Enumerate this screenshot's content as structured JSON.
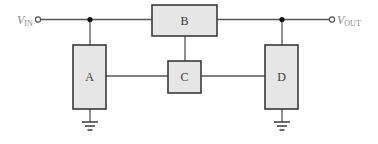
{
  "diagram": {
    "type": "block-diagram",
    "terminals": {
      "input": {
        "symbol": "V",
        "subscript": "IN"
      },
      "output": {
        "symbol": "V",
        "subscript": "OUT"
      }
    },
    "blocks": [
      {
        "id": "A",
        "label": "A"
      },
      {
        "id": "B",
        "label": "B"
      },
      {
        "id": "C",
        "label": "C"
      },
      {
        "id": "D",
        "label": "D"
      }
    ],
    "connections": [
      {
        "from": "V_IN",
        "to": "B"
      },
      {
        "from": "V_IN",
        "to": "A"
      },
      {
        "from": "B",
        "to": "V_OUT"
      },
      {
        "from": "V_OUT",
        "to": "D"
      },
      {
        "from": "B",
        "to": "C"
      },
      {
        "from": "A",
        "to": "C"
      },
      {
        "from": "C",
        "to": "D"
      },
      {
        "from": "A",
        "to": "ground"
      },
      {
        "from": "D",
        "to": "ground"
      }
    ],
    "colors": {
      "block_fill": "#e6e6e6",
      "block_stroke": "#3a3a3a",
      "wire": "#555555",
      "terminal_label": "#8a8a8a"
    }
  }
}
